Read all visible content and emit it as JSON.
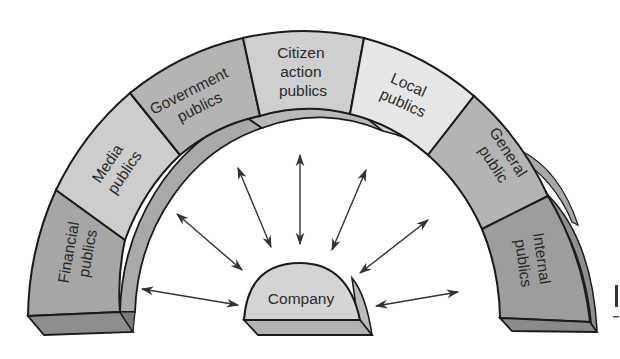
{
  "diagram": {
    "type": "arch-of-publics",
    "center_node": {
      "label": "Company",
      "fill": "#d4d4d4",
      "base_fill": "#b2b2b2"
    },
    "segments": [
      {
        "id": "financial",
        "lines": [
          "Financial",
          "publics"
        ],
        "fill": "#a6a6a6"
      },
      {
        "id": "media",
        "lines": [
          "Media",
          "publics"
        ],
        "fill": "#cdcdcd"
      },
      {
        "id": "government",
        "lines": [
          "Government",
          "publics"
        ],
        "fill": "#b4b4b4"
      },
      {
        "id": "citizen-action",
        "lines": [
          "Citizen",
          "action",
          "publics"
        ],
        "fill": "#cfcfcf"
      },
      {
        "id": "local",
        "lines": [
          "Local",
          "publics"
        ],
        "fill": "#e6e6e6"
      },
      {
        "id": "general",
        "lines": [
          "General",
          "public"
        ],
        "fill": "#b4b4b4"
      },
      {
        "id": "internal",
        "lines": [
          "Internal",
          "publics"
        ],
        "fill": "#9d9d9d"
      }
    ],
    "relationships": "bidirectional arrows between Company and each public",
    "arrow_count": 8,
    "colors": {
      "outline": "#1a1a1a",
      "arrow": "#333333",
      "text": "#2a2a2a",
      "background": "#ffffff"
    }
  }
}
